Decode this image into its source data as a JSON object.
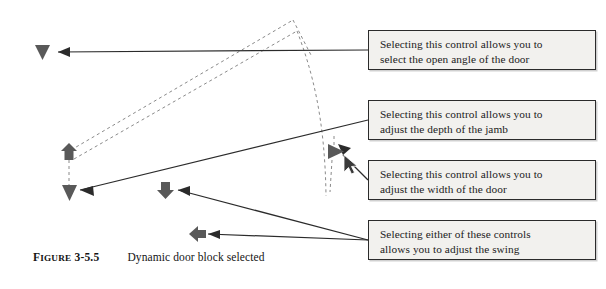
{
  "figure": {
    "label_first_letter": "F",
    "label_rest": "IGURE",
    "number": "3-5.5",
    "title": "Dynamic door block selected"
  },
  "callouts": [
    {
      "name": "callout-open-angle",
      "line1": "Selecting this control allows you to",
      "line2": "select the open angle of the door",
      "x": 368,
      "y": 30,
      "w": 228,
      "h": 40
    },
    {
      "name": "callout-jamb-depth",
      "line1": "Selecting this control allows you to",
      "line2": "adjust the depth of the jamb",
      "x": 368,
      "y": 100,
      "w": 228,
      "h": 40
    },
    {
      "name": "callout-door-width",
      "line1": "Selecting this control allows you to",
      "line2": "adjust the width of the door",
      "x": 368,
      "y": 160,
      "w": 228,
      "h": 40
    },
    {
      "name": "callout-swing",
      "line1": "Selecting either of these controls",
      "line2": "allows you to adjust the swing",
      "x": 368,
      "y": 220,
      "w": 228,
      "h": 40
    }
  ],
  "grips": [
    {
      "name": "grip-open-angle-triangle",
      "shape": "triangle-down",
      "x": 42,
      "y": 51
    },
    {
      "name": "grip-hinge-arrow-up",
      "shape": "arrow-up",
      "x": 69,
      "y": 152
    },
    {
      "name": "grip-jamb-triangle-down",
      "shape": "triangle-down",
      "x": 69,
      "y": 192
    },
    {
      "name": "grip-swing-arrow-down",
      "shape": "arrow-down",
      "x": 165,
      "y": 190
    },
    {
      "name": "grip-swing-arrow-left",
      "shape": "arrow-left",
      "x": 197,
      "y": 234
    },
    {
      "name": "grip-door-width-triangle-right",
      "shape": "triangle-right",
      "x": 335,
      "y": 151
    }
  ],
  "colors": {
    "grip_fill": "#595959",
    "line_stroke": "#2b2b2b",
    "dashed_stroke": "#8a8a8a",
    "callout_fill": "#f2f1ee",
    "callout_border": "#2b2b2b",
    "cursor_fill": "#3a3a3a"
  },
  "cursor": {
    "name": "mouse-cursor",
    "x": 345,
    "y": 157
  }
}
